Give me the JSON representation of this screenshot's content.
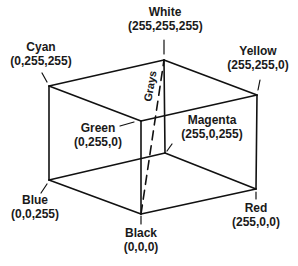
{
  "diagram": {
    "vertices": [
      {
        "id": "white",
        "name": "White",
        "rgb": "(255,255,255)",
        "x": 164,
        "y": 60
      },
      {
        "id": "cyan",
        "name": "Cyan",
        "rgb": "(0,255,255)",
        "x": 49,
        "y": 86
      },
      {
        "id": "yellow",
        "name": "Yellow",
        "rgb": "(255,255,0)",
        "x": 257,
        "y": 95
      },
      {
        "id": "green",
        "name": "Green",
        "rgb": "(0,255,0)",
        "x": 141,
        "y": 121
      },
      {
        "id": "magenta",
        "name": "Magenta",
        "rgb": "(255,0,255)",
        "x": 165,
        "y": 153
      },
      {
        "id": "blue",
        "name": "Blue",
        "rgb": "(0,0,255)",
        "x": 49,
        "y": 180
      },
      {
        "id": "red",
        "name": "Red",
        "rgb": "(255,0,0)",
        "x": 256,
        "y": 189
      },
      {
        "id": "black",
        "name": "Black",
        "rgb": "(0,0,0)",
        "x": 141,
        "y": 214
      }
    ],
    "diagonal_label": "Grays",
    "line_color": "#111111"
  },
  "labels": {
    "white": {
      "name": "White",
      "rgb": "(255,255,255)"
    },
    "cyan": {
      "name": "Cyan",
      "rgb": "(0,255,255)"
    },
    "yellow": {
      "name": "Yellow",
      "rgb": "(255,255,0)"
    },
    "green": {
      "name": "Green",
      "rgb": "(0,255,0)"
    },
    "magenta": {
      "name": "Magenta",
      "rgb": "(255,0,255)"
    },
    "blue": {
      "name": "Blue",
      "rgb": "(0,0,255)"
    },
    "red": {
      "name": "Red",
      "rgb": "(255,0,0)"
    },
    "black": {
      "name": "Black",
      "rgb": "(0,0,0)"
    },
    "grays": "Grays"
  }
}
